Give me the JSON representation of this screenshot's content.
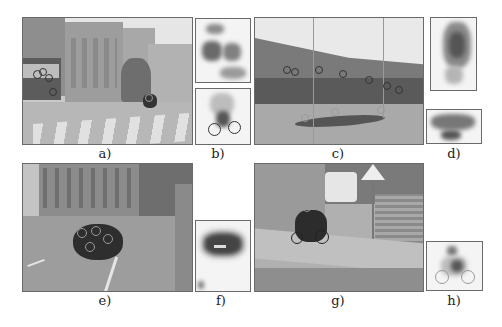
{
  "figure": {
    "panels": [
      {
        "id": "a",
        "label": "a)",
        "description": "Street scene with tram, buildings, crosswalk and cyclist; detection circles on tram and cyclist"
      },
      {
        "id": "b",
        "label": "b)",
        "description": "Two patch-voting back-projection maps: building/tram region and cyclist"
      },
      {
        "id": "c",
        "label": "c)",
        "description": "Tram along a street with many detection circles along its body"
      },
      {
        "id": "d",
        "label": "d)",
        "description": "Two back-projection maps of tram front and tram side"
      },
      {
        "id": "e",
        "label": "e)",
        "description": "Intersection scene with buildings and dense cluster of detection circles on a car"
      },
      {
        "id": "f",
        "label": "f)",
        "description": "Back-projection map of a car seen from behind"
      },
      {
        "id": "g",
        "label": "g)",
        "description": "Street with van, warning sign, stairs, and cyclist with detection circles"
      },
      {
        "id": "h",
        "label": "h)",
        "description": "Back-projection map of cyclist"
      }
    ]
  },
  "colors": {
    "background": "#ffffff",
    "panel_border": "#6a6a6a",
    "label_text": "#222222"
  }
}
